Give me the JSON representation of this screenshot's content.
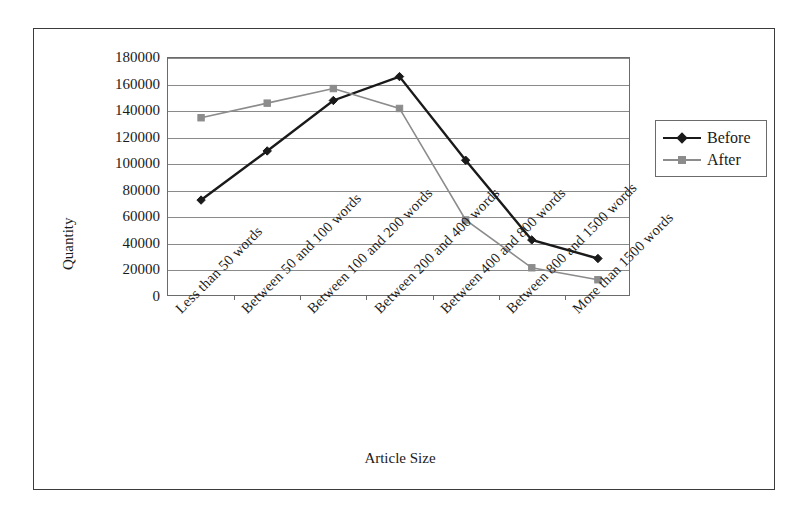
{
  "chart_data": {
    "type": "line",
    "title": "",
    "xlabel": "Article Size",
    "ylabel": "Quantity",
    "ylim": [
      0,
      180000
    ],
    "ytick_labels": [
      "180000",
      "160000",
      "140000",
      "120000",
      "100000",
      "80000",
      "60000",
      "40000",
      "20000",
      "0"
    ],
    "ytick_values": [
      180000,
      160000,
      140000,
      120000,
      100000,
      80000,
      60000,
      40000,
      20000,
      0
    ],
    "grid": true,
    "legend_position": "right",
    "categories": [
      "Less than 50 words",
      "Between 50 and 100 words",
      "Between 100 and 200 words",
      "Between 200 and 400 words",
      "Between 400 and 800 words",
      "Between 800 and 1500 words",
      "More than 1500 words"
    ],
    "series": [
      {
        "name": "Before",
        "color": "#1a1a1a",
        "marker": "diamond",
        "values": [
          73000,
          110000,
          148000,
          166000,
          103000,
          43000,
          29000
        ]
      },
      {
        "name": "After",
        "color": "#8c8c8c",
        "marker": "square",
        "values": [
          135000,
          146000,
          157000,
          142000,
          58000,
          22000,
          13000
        ]
      }
    ]
  },
  "legend": {
    "items": [
      {
        "label": "Before"
      },
      {
        "label": "After"
      }
    ]
  },
  "axes": {
    "x_title": "Article Size",
    "y_title": "Quantity"
  },
  "colors": {
    "before": "#1a1a1a",
    "after": "#8c8c8c",
    "gridline": "#8a8a8a",
    "frame": "#3b3b3b",
    "axis": "#6b6b6b",
    "background": "#ffffff"
  }
}
